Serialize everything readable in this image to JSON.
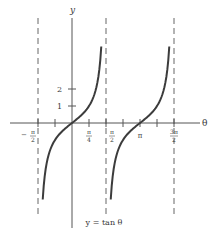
{
  "figure": {
    "caption": "y = tan θ",
    "x_axis_label": "θ",
    "y_axis_label": "y",
    "x_tick_labels": [
      {
        "num": "π",
        "den": "2",
        "sign": "−",
        "value": -1.5708
      },
      {
        "num": "π",
        "den": "4",
        "sign": "",
        "value": 0.7854
      },
      {
        "num": "π",
        "den": "2",
        "sign": "",
        "value": 1.5708
      },
      {
        "num": "π",
        "den": "",
        "sign": "",
        "value": 3.1416
      },
      {
        "num": "3π",
        "den": "2",
        "sign": "",
        "value": 4.7124
      }
    ],
    "y_tick_labels": [
      "1",
      "2"
    ],
    "function": "tan",
    "asymptotes": [
      "-π/2",
      "π/2",
      "3π/2"
    ],
    "branches": [
      {
        "center": "0",
        "range": [
          "-π/2",
          "π/2"
        ]
      },
      {
        "center": "π",
        "range": [
          "π/2",
          "3π/2"
        ]
      }
    ],
    "colors": {
      "curve": "#3c3c3c",
      "axes": "#555555",
      "asymptote": "#666666",
      "background": "#ffffff"
    }
  }
}
